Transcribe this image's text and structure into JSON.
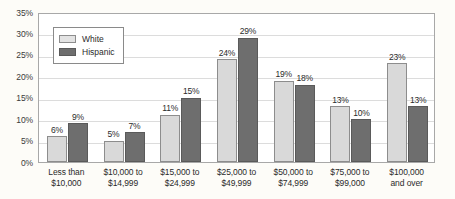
{
  "chart_data": {
    "type": "bar",
    "title": "",
    "subtitle": "",
    "xlabel": "",
    "ylabel": "",
    "ylim": [
      0,
      35
    ],
    "ytick_labels": [
      "0%",
      "5%",
      "10%",
      "15%",
      "20%",
      "25%",
      "30%",
      "35%"
    ],
    "ytick_values": [
      0,
      5,
      10,
      15,
      20,
      25,
      30,
      35
    ],
    "grid": true,
    "legend_position": "top-left-inside",
    "categories": [
      "Less than $10,000",
      "$10,000 to $14,999",
      "$15,000 to $24,999",
      "$25,000 to $49,999",
      "$50,000 to $74,999",
      "$75,000 to $99,000",
      "$100,000 and over"
    ],
    "category_lines": [
      [
        "Less than",
        "$10,000"
      ],
      [
        "$10,000 to",
        "$14,999"
      ],
      [
        "$15,000 to",
        "$24,999"
      ],
      [
        "$25,000 to",
        "$49,999"
      ],
      [
        "$50,000 to",
        "$74,999"
      ],
      [
        "$75,000 to",
        "$99,000"
      ],
      [
        "$100,000",
        "and over"
      ]
    ],
    "series": [
      {
        "name": "White",
        "color": "#d9d9d9",
        "values": [
          6,
          5,
          11,
          24,
          19,
          13,
          23
        ],
        "labels": [
          "6%",
          "5%",
          "11%",
          "24%",
          "19%",
          "13%",
          "23%"
        ]
      },
      {
        "name": "Hispanic",
        "color": "#6e6e6e",
        "values": [
          9,
          7,
          15,
          29,
          18,
          10,
          13
        ],
        "labels": [
          "9%",
          "7%",
          "15%",
          "29%",
          "18%",
          "10%",
          "13%"
        ]
      }
    ]
  },
  "legend": {
    "items": [
      {
        "label": "White"
      },
      {
        "label": "Hispanic"
      }
    ]
  },
  "colors": {
    "white_series": "#d9d9d9",
    "hispanic_series": "#6e6e6e",
    "gridline": "#dcdcdc",
    "plot_border": "#a8a8a8",
    "page_background": "#fdfcf8"
  }
}
